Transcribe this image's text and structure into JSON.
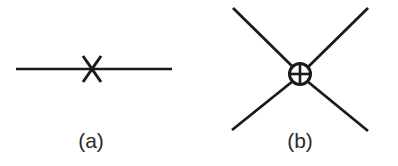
{
  "figure": {
    "background_color": "#ffffff",
    "stroke_color": "#1a1a1a",
    "label_color": "#2b2b2b",
    "width": 398,
    "height": 166,
    "panels": [
      {
        "id": "a",
        "label": "(a)",
        "description": "propagator line with cross insertion",
        "elements": [
          {
            "name": "propagator-line",
            "type": "line",
            "x1": 16,
            "y1": 69,
            "x2": 172,
            "y2": 69,
            "stroke_width": 2.6
          },
          {
            "name": "cross-mark-stroke-1",
            "type": "line",
            "x1": 83,
            "y1": 56,
            "x2": 101,
            "y2": 82,
            "stroke_width": 3.0
          },
          {
            "name": "cross-mark-stroke-2",
            "type": "line",
            "x1": 101,
            "y1": 56,
            "x2": 83,
            "y2": 82,
            "stroke_width": 3.0
          }
        ]
      },
      {
        "id": "b",
        "label": "(b)",
        "description": "four-point vertex with circled-plus blob",
        "elements": [
          {
            "name": "leg-upper-left",
            "type": "line",
            "x1": 233,
            "y1": 8,
            "x2": 292,
            "y2": 66,
            "stroke_width": 2.8
          },
          {
            "name": "leg-upper-right",
            "type": "line",
            "x1": 368,
            "y1": 8,
            "x2": 309,
            "y2": 66,
            "stroke_width": 2.8
          },
          {
            "name": "leg-lower-left",
            "type": "line",
            "x1": 232,
            "y1": 130,
            "x2": 292,
            "y2": 82,
            "stroke_width": 2.8
          },
          {
            "name": "leg-lower-right",
            "type": "line",
            "x1": 368,
            "y1": 131,
            "x2": 309,
            "y2": 82,
            "stroke_width": 2.8
          },
          {
            "name": "vertex-circle",
            "type": "circle",
            "cx": 300,
            "cy": 74,
            "r": 11,
            "stroke_width": 3.0,
            "fill": "#ffffff"
          },
          {
            "name": "vertex-plus-horizontal",
            "type": "line",
            "x1": 290,
            "y1": 74,
            "x2": 310,
            "y2": 74,
            "stroke_width": 2.6
          },
          {
            "name": "vertex-plus-vertical",
            "type": "line",
            "x1": 300,
            "y1": 64,
            "x2": 300,
            "y2": 84,
            "stroke_width": 2.6
          }
        ]
      }
    ]
  }
}
